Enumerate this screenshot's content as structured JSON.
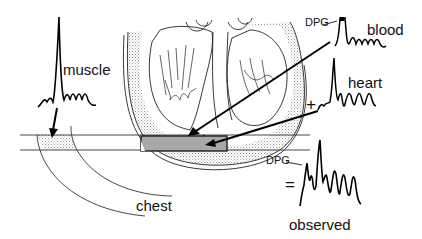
{
  "diagram": {
    "labels": {
      "muscle": "muscle",
      "blood": "blood",
      "heart": "heart",
      "chest": "chest",
      "observed": "observed",
      "dpg_blood": "DPG",
      "dpg_observed": "DPG",
      "plus": "+",
      "equals": "="
    },
    "colors": {
      "ink": "#111111",
      "voxel_fill": "#a8a8a8",
      "stipple": "#d0d0d0",
      "background": "#ffffff"
    },
    "spectra": [
      {
        "name": "muscle",
        "description": "single dominant peak with small multiplet"
      },
      {
        "name": "blood",
        "description": "DPG peak with small multiplet"
      },
      {
        "name": "heart",
        "description": "tall peak with three resolved peaks"
      },
      {
        "name": "observed",
        "description": "sum: DPG shoulder plus heart peaks"
      }
    ],
    "regions": [
      "chest wall",
      "heart",
      "voxel"
    ]
  }
}
